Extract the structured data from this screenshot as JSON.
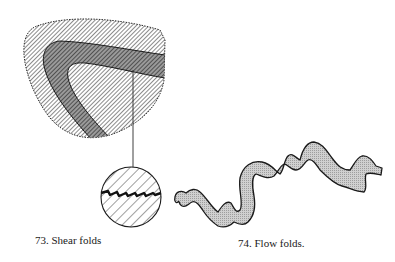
{
  "figures": [
    {
      "id": "73",
      "caption": "73. Shear folds",
      "elements": [
        "hatched-rock-mass",
        "dark-shear-band",
        "leader-line",
        "circular-inset-with-shear-zigzag"
      ]
    },
    {
      "id": "74",
      "caption": "74. Flow folds.",
      "elements": [
        "wavy-flow-fold-band"
      ]
    }
  ],
  "colors": {
    "ink": "#1a1a1a",
    "hatch": "#333333",
    "band_fill": "#8a8a8a",
    "flow_fill": "#c8c8c8",
    "background": "#ffffff"
  }
}
